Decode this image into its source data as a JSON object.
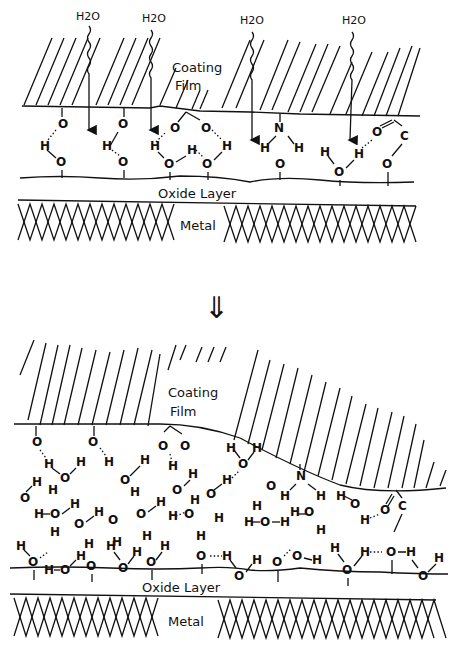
{
  "figure": {
    "top_panel": {
      "coating_label_line1": "Coating",
      "coating_label_line2": "Film",
      "oxide_label": "Oxide Layer",
      "metal_label": "Metal",
      "water_labels": [
        "H2O",
        "H2O",
        "H2O",
        "H2O"
      ]
    },
    "transition_arrow": "⇓",
    "bottom_panel": {
      "coating_label_line1": "Coating",
      "coating_label_line2": "Film",
      "oxide_label": "Oxide Layer",
      "metal_label": "Metal"
    },
    "atoms": {
      "oxygen": "O",
      "hydrogen": "H",
      "nitrogen": "N",
      "carbon": "C"
    }
  }
}
